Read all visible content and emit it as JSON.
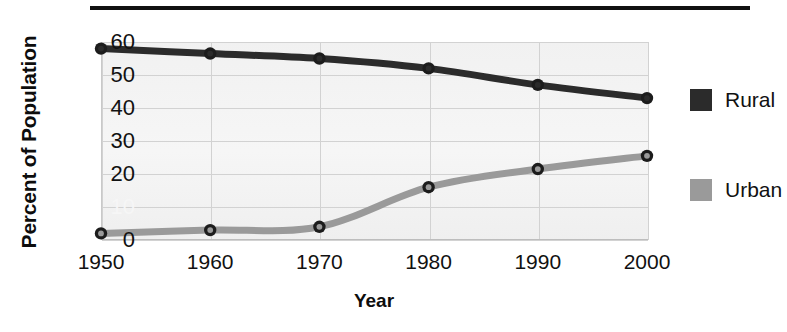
{
  "chart_data": {
    "type": "line",
    "title": "",
    "xlabel": "Year",
    "ylabel": "Percent of Population",
    "categories": [
      "1950",
      "1960",
      "1970",
      "1980",
      "1990",
      "2000"
    ],
    "x": [
      1950,
      1960,
      1970,
      1980,
      1990,
      2000
    ],
    "series": [
      {
        "name": "Rural",
        "color": "#2b2b2b",
        "values": [
          58,
          56.5,
          55,
          52,
          47,
          43
        ]
      },
      {
        "name": "Urban",
        "color": "#9a9a9a",
        "values": [
          2,
          3,
          4,
          16,
          21.5,
          25.5
        ]
      }
    ],
    "ylim": [
      0,
      60
    ],
    "yticks": [
      "0",
      "10",
      "20",
      "30",
      "40",
      "50",
      "60"
    ],
    "ytick_values": [
      0,
      10,
      20,
      30,
      40,
      50,
      60
    ],
    "ytick_faded": [
      "10"
    ],
    "xlim": [
      1950,
      2000
    ],
    "grid": true,
    "legend_position": "right",
    "plot_background": "#f3f3f3",
    "marker": "circle-open"
  },
  "legend": {
    "entries": [
      {
        "label": "Rural",
        "color": "#2b2b2b"
      },
      {
        "label": "Urban",
        "color": "#9a9a9a"
      }
    ]
  },
  "colors": {
    "rural": "#2b2b2b",
    "urban": "#9a9a9a",
    "grid": "#d2d2d2",
    "rule": "#111111",
    "plot_bg": "#f3f3f3"
  }
}
